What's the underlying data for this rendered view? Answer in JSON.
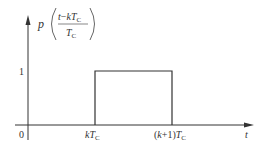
{
  "figure": {
    "type": "rectangular-pulse-plot",
    "function_label": {
      "name": "p",
      "numerator": {
        "var": "t",
        "minus": "−",
        "k": "k",
        "T": "T",
        "sub": "C"
      },
      "denominator": {
        "T": "T",
        "sub": "C"
      }
    },
    "y_axis": {
      "tick_label": "1"
    },
    "x_axis": {
      "origin_label": "0",
      "axis_label": "t",
      "tick_start": {
        "k": "k",
        "T": "T",
        "sub": "C"
      },
      "tick_end": {
        "prefix": "(",
        "k": "k",
        "plus": "+1)",
        "T": "T",
        "sub": "C"
      }
    },
    "pulse": {
      "amplitude": 1,
      "start": "kT_C",
      "end": "(k+1)T_C"
    },
    "colors": {
      "line": "#333333",
      "background": "#ffffff"
    }
  }
}
